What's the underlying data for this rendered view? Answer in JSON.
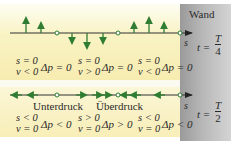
{
  "wall": {
    "label": "Wand",
    "color": "#b0b0b0"
  },
  "top_panel": {
    "time_prefix": "t =",
    "time_num": "T",
    "time_den": "4",
    "axis_label": "s",
    "arrow_direction_note": "vertical displacement arrows (up/down)",
    "columns": [
      {
        "s": "s = 0",
        "v": "v < 0",
        "dp": "Δp = 0"
      },
      {
        "s": "s = 0",
        "v": "v > 0",
        "dp": "Δp = 0"
      },
      {
        "s": "s = 0",
        "v": "v < 0",
        "dp": "Δp = 0"
      }
    ]
  },
  "bottom_panel": {
    "time_prefix": "t =",
    "time_num": "T",
    "time_den": "2",
    "axis_label": "s",
    "region_labels": [
      "Unterdruck",
      "Überdruck"
    ],
    "columns": [
      {
        "s": "s < 0",
        "v": "v = 0",
        "dp": "Δp < 0"
      },
      {
        "s": "s > 0",
        "v": "v = 0",
        "dp": "Δp > 0"
      },
      {
        "s": "s < 0",
        "v": "v = 0",
        "dp": "Δp < 0"
      }
    ]
  },
  "colors": {
    "arrow": "#2f7d32",
    "axis": "#333333",
    "band": "#f8efb8"
  }
}
